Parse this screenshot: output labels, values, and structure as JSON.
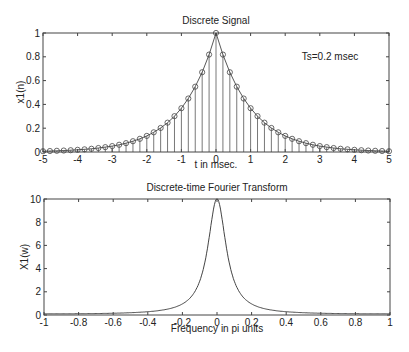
{
  "chart_data": [
    {
      "type": "scatter",
      "subtype": "stem",
      "title": "Discrete Signal",
      "xlabel": "t in msec.",
      "ylabel": "x1(n)",
      "annotation": "Ts=0.2 msec",
      "xlim": [
        -5,
        5
      ],
      "ylim": [
        0,
        1
      ],
      "xticks": [
        -5,
        -4,
        -3,
        -2,
        -1,
        0,
        1,
        2,
        3,
        4,
        5
      ],
      "yticks": [
        0,
        0.2,
        0.4,
        0.6,
        0.8,
        1
      ],
      "ytick_labels": [
        "0",
        "0.2",
        "0.4",
        "0.6",
        "0.8",
        "1"
      ],
      "grid": false,
      "formula": "x(t)=exp(-|t|), t=-5:0.2:5",
      "x": [
        -5,
        -4.8,
        -4.6,
        -4.4,
        -4.2,
        -4,
        -3.8,
        -3.6,
        -3.4,
        -3.2,
        -3,
        -2.8,
        -2.6,
        -2.4,
        -2.2,
        -2,
        -1.8,
        -1.6,
        -1.4,
        -1.2,
        -1,
        -0.8,
        -0.6,
        -0.4,
        -0.2,
        0,
        0.2,
        0.4,
        0.6,
        0.8,
        1,
        1.2,
        1.4,
        1.6,
        1.8,
        2,
        2.2,
        2.4,
        2.6,
        2.8,
        3,
        3.2,
        3.4,
        3.6,
        3.8,
        4,
        4.2,
        4.4,
        4.6,
        4.8,
        5
      ],
      "values": [
        0.0067,
        0.0082,
        0.0101,
        0.0123,
        0.015,
        0.0183,
        0.0224,
        0.0273,
        0.0334,
        0.0408,
        0.0498,
        0.0608,
        0.0743,
        0.0907,
        0.1108,
        0.1353,
        0.1653,
        0.2019,
        0.2466,
        0.3012,
        0.3679,
        0.4493,
        0.5488,
        0.6703,
        0.8187,
        1,
        0.8187,
        0.6703,
        0.5488,
        0.4493,
        0.3679,
        0.3012,
        0.2466,
        0.2019,
        0.1653,
        0.1353,
        0.1108,
        0.0907,
        0.0743,
        0.0608,
        0.0498,
        0.0408,
        0.0334,
        0.0273,
        0.0224,
        0.0183,
        0.015,
        0.0123,
        0.0101,
        0.0082,
        0.0067
      ]
    },
    {
      "type": "line",
      "title": "Discrete-time Fourier Transform",
      "xlabel": "Frequency in pi units",
      "ylabel": "X1(w)",
      "xlim": [
        -1,
        1
      ],
      "ylim": [
        0,
        10
      ],
      "xticks": [
        -1,
        -0.8,
        -0.6,
        -0.4,
        -0.2,
        0,
        0.2,
        0.4,
        0.6,
        0.8,
        1
      ],
      "yticks": [
        0,
        2,
        4,
        6,
        8,
        10
      ],
      "grid": false,
      "formula": "X(w)=(1-a^2)/(1-2a cos(w pi)+a^2), a=0.8187",
      "x": [
        -1,
        -0.8,
        -0.6,
        -0.4,
        -0.2,
        -0.1,
        -0.05,
        0,
        0.05,
        0.1,
        0.2,
        0.4,
        0.6,
        0.8,
        1
      ],
      "values": [
        0.1,
        0.11,
        0.15,
        0.26,
        0.79,
        2.4,
        5.0,
        10.0,
        5.0,
        2.4,
        0.79,
        0.26,
        0.15,
        0.11,
        0.1
      ]
    }
  ]
}
